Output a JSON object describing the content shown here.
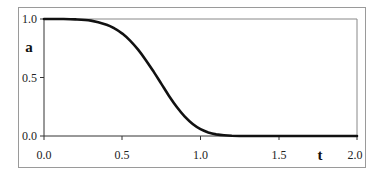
{
  "chart_data": {
    "type": "line",
    "title": "",
    "xlabel": "t",
    "ylabel": "a",
    "xlim": [
      0.0,
      2.0
    ],
    "ylim": [
      0.0,
      1.0
    ],
    "x_ticks": [
      "0.0",
      "0.5",
      "1.0",
      "1.5",
      "2.0"
    ],
    "y_ticks": [
      "0.0",
      "0.5",
      "1.0"
    ],
    "grid": false,
    "legend": null,
    "series": [
      {
        "name": "a(t)",
        "color": "#111111",
        "x": [
          0.0,
          0.1,
          0.2,
          0.3,
          0.4,
          0.45,
          0.5,
          0.55,
          0.6,
          0.65,
          0.7,
          0.75,
          0.8,
          0.85,
          0.9,
          0.95,
          1.0,
          1.05,
          1.1,
          1.15,
          1.2,
          1.3,
          1.4,
          1.5,
          1.6,
          1.7,
          1.8,
          1.9,
          2.0
        ],
        "y": [
          1.0,
          1.0,
          0.997,
          0.986,
          0.951,
          0.92,
          0.875,
          0.815,
          0.74,
          0.65,
          0.55,
          0.445,
          0.34,
          0.245,
          0.165,
          0.102,
          0.058,
          0.03,
          0.014,
          0.006,
          0.002,
          0.0,
          0.0,
          0.0,
          0.0,
          0.0,
          0.0,
          0.0,
          0.0
        ]
      }
    ]
  },
  "axes": {
    "x_label": "t",
    "y_label": "a",
    "x_tick_labels": [
      "0.0",
      "0.5",
      "1.0",
      "1.5",
      "2.0"
    ],
    "y_tick_labels": [
      "1.0",
      "0.5",
      "0.0"
    ]
  }
}
